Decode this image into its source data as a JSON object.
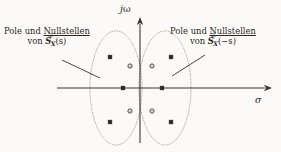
{
  "figure": {
    "name": "pole-zero-plot-s-plane",
    "background_color": "#fbfaf8",
    "ink_color": "#2b2723",
    "axis_color": "#3a3531",
    "ellipse_color": "#8d8882"
  },
  "axes": {
    "imaginary_label": "jω",
    "imaginary_label_j": "j",
    "imaginary_label_omega": "ω",
    "real_label": "σ",
    "origin": {
      "x": 140,
      "y": 88
    },
    "real_axis": {
      "x_start": 57,
      "x_end": 272,
      "y": 88
    },
    "imag_axis": {
      "x": 140,
      "y_start": 17,
      "y_end": 143
    }
  },
  "annotations": [
    {
      "id": "label-left",
      "line1_pre": "Pole und ",
      "line1_underlined": "Nullstellen",
      "line2_pre": "von ",
      "symbol_base": "S",
      "symbol_sub": "X",
      "symbol_arg": "(s)",
      "accent": "double-tilde",
      "target": "left-ellipse"
    },
    {
      "id": "label-right",
      "line1_pre": "Pole und ",
      "line1_underlined": "Nullstellen",
      "line2_pre": "von ",
      "symbol_base": "S",
      "symbol_sub": "X",
      "symbol_arg": "(−s)",
      "accent": "double-tilde",
      "target": "right-ellipse"
    }
  ],
  "chart_data": {
    "type": "scatter",
    "title": "",
    "xlabel": "σ",
    "ylabel": "jω",
    "xlim": [
      -1.6,
      1.6
    ],
    "ylim": [
      -1.3,
      1.3
    ],
    "grid": false,
    "legend": "none",
    "marker_legend": {
      "pole": "filled-square",
      "zero": "open-circle"
    },
    "series": [
      {
        "name": "Pole und Nullstellen von S_X(s)",
        "group": "left-half-plane",
        "points": [
          {
            "marker": "pole",
            "type": "pole",
            "px": 110,
            "py": 57
          },
          {
            "marker": "zero",
            "type": "zero",
            "px": 130,
            "py": 66
          },
          {
            "marker": "pole",
            "type": "pole",
            "px": 123,
            "py": 88
          },
          {
            "marker": "zero",
            "type": "zero",
            "px": 130,
            "py": 111
          },
          {
            "marker": "pole",
            "type": "pole",
            "px": 110,
            "py": 122
          }
        ]
      },
      {
        "name": "Pole und Nullstellen von S_X(−s)",
        "group": "right-half-plane",
        "points": [
          {
            "marker": "pole",
            "type": "pole",
            "px": 171,
            "py": 57
          },
          {
            "marker": "zero",
            "type": "zero",
            "px": 152,
            "py": 66
          },
          {
            "marker": "pole",
            "type": "pole",
            "px": 162,
            "py": 88
          },
          {
            "marker": "zero",
            "type": "zero",
            "px": 152,
            "py": 111
          },
          {
            "marker": "pole",
            "type": "pole",
            "px": 171,
            "py": 122
          }
        ]
      }
    ],
    "ellipses": [
      {
        "name": "left-ellipse",
        "cx": 116,
        "cy": 88,
        "rx": 26,
        "ry": 57,
        "style": "dotted"
      },
      {
        "name": "right-ellipse",
        "cx": 165,
        "cy": 88,
        "rx": 26,
        "ry": 57,
        "style": "dotted"
      }
    ],
    "leader_lines": [
      {
        "name": "leader-left",
        "x1": 62,
        "y1": 60,
        "x2": 100,
        "y2": 78
      },
      {
        "name": "leader-right",
        "x1": 205,
        "y1": 55,
        "x2": 172,
        "y2": 76
      }
    ]
  }
}
